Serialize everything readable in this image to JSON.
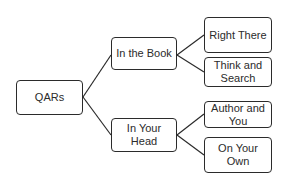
{
  "diagram": {
    "type": "tree",
    "root": {
      "label": "QARs"
    },
    "branches": [
      {
        "label": "In the Book",
        "children": [
          {
            "label": "Right There"
          },
          {
            "label": "Think and Search"
          }
        ]
      },
      {
        "label": "In Your Head",
        "children": [
          {
            "label": "Author and You"
          },
          {
            "label": "On Your Own"
          }
        ]
      }
    ],
    "colors": {
      "stroke": "#2b2b2b",
      "fill": "#ffffff",
      "text": "#2b2b2b",
      "background": "#ffffff"
    }
  }
}
